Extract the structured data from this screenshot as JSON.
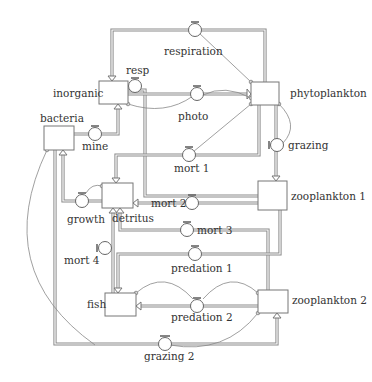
{
  "diagram": {
    "stocks": [
      {
        "id": "inorganic",
        "label": "inorganic",
        "x": 99,
        "y": 81,
        "w": 29,
        "h": 23
      },
      {
        "id": "phytoplankton",
        "label": "phytoplankton",
        "x": 251,
        "y": 82,
        "w": 28,
        "h": 23
      },
      {
        "id": "bacteria",
        "label": "bacteria",
        "x": 44,
        "y": 126,
        "w": 30,
        "h": 24
      },
      {
        "id": "detritus",
        "label": "detritus",
        "x": 102,
        "y": 183,
        "w": 31,
        "h": 25
      },
      {
        "id": "zooplankton1",
        "label": "zooplankton 1",
        "x": 258,
        "y": 181,
        "w": 29,
        "h": 29
      },
      {
        "id": "fish",
        "label": "fish",
        "x": 105,
        "y": 293,
        "w": 31,
        "h": 23
      },
      {
        "id": "zooplankton2",
        "label": "zooplankton 2",
        "x": 258,
        "y": 290,
        "w": 30,
        "h": 23
      }
    ],
    "flows": [
      {
        "id": "respiration",
        "label": "respiration",
        "from": "phytoplankton",
        "to": "inorganic"
      },
      {
        "id": "resp",
        "label": "resp",
        "from": "zooplankton1",
        "to": "inorganic"
      },
      {
        "id": "photo",
        "label": "photo",
        "from": "inorganic",
        "to": "phytoplankton"
      },
      {
        "id": "mine",
        "label": "mine",
        "from": "bacteria",
        "to": "inorganic"
      },
      {
        "id": "grazing",
        "label": "grazing",
        "from": "phytoplankton",
        "to": "zooplankton1"
      },
      {
        "id": "mort1",
        "label": "mort 1",
        "from": "phytoplankton",
        "to": "detritus"
      },
      {
        "id": "mort2",
        "label": "mort 2",
        "from": "zooplankton1",
        "to": "detritus"
      },
      {
        "id": "mort3",
        "label": "mort 3",
        "from": "zooplankton2",
        "to": "detritus"
      },
      {
        "id": "growth",
        "label": "growth",
        "from": "detritus",
        "to": "bacteria"
      },
      {
        "id": "mort4",
        "label": "mort 4",
        "from": "fish",
        "to": "detritus"
      },
      {
        "id": "predation1",
        "label": "predation 1",
        "from": "zooplankton1",
        "to": "fish"
      },
      {
        "id": "predation2",
        "label": "predation 2",
        "from": "zooplankton2",
        "to": "fish"
      },
      {
        "id": "grazing2",
        "label": "grazing 2",
        "from": "bacteria",
        "to": "zooplankton2"
      }
    ]
  }
}
